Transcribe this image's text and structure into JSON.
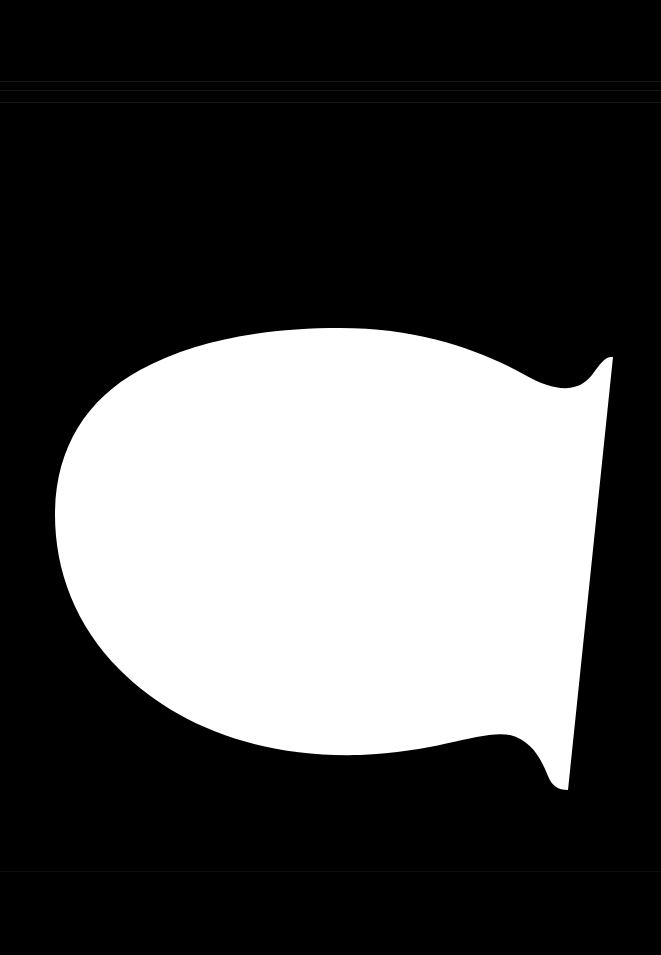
{
  "image": {
    "background_color": "#000000",
    "shape": {
      "description": "white silhouette",
      "fill_color": "#ffffff"
    }
  }
}
